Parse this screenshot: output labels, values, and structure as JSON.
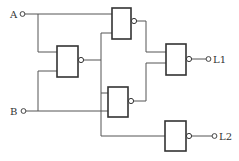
{
  "diagram": {
    "type": "logic-circuit",
    "gate_type": "NAND",
    "inputs": [
      {
        "id": "A",
        "label": "A"
      },
      {
        "id": "B",
        "label": "B"
      }
    ],
    "outputs": [
      {
        "id": "L1",
        "label": "L1"
      },
      {
        "id": "L2",
        "label": "L2"
      }
    ],
    "gates": [
      {
        "id": "G1",
        "name": "nand-gate-left",
        "inputs": [
          "A",
          "B"
        ]
      },
      {
        "id": "G2",
        "name": "nand-gate-top",
        "inputs": [
          "A",
          "G1"
        ]
      },
      {
        "id": "G3",
        "name": "nand-gate-lower",
        "inputs": [
          "G1",
          "B"
        ]
      },
      {
        "id": "G4",
        "name": "nand-gate-l1",
        "inputs": [
          "G2",
          "G3"
        ],
        "drives": "L1"
      },
      {
        "id": "G5",
        "name": "nand-gate-l2",
        "inputs": [
          "G1"
        ],
        "drives": "L2"
      }
    ],
    "colors": {
      "line": "#555555",
      "gate": "#333333",
      "background": "#ffffff"
    }
  }
}
